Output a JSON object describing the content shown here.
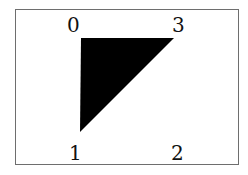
{
  "diagram": {
    "type": "polygon-vertex-diagram",
    "vertices": [
      {
        "id": "0",
        "label": "0",
        "x": 81,
        "y": 38
      },
      {
        "id": "1",
        "label": "1",
        "x": 80,
        "y": 132
      },
      {
        "id": "2",
        "label": "2",
        "x": 174,
        "y": 132
      },
      {
        "id": "3",
        "label": "3",
        "x": 174,
        "y": 38
      }
    ],
    "filled_triangle": [
      "0",
      "3",
      "1"
    ],
    "fill_color": "#000000",
    "border_color": "#6e6e6e"
  }
}
